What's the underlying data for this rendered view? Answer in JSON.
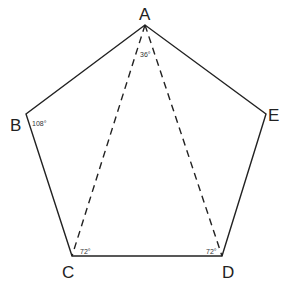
{
  "diagram": {
    "vertices": [
      {
        "label": "A",
        "x": 145,
        "y": 25
      },
      {
        "label": "B",
        "x": 26,
        "y": 114
      },
      {
        "label": "C",
        "x": 72,
        "y": 256
      },
      {
        "label": "D",
        "x": 222,
        "y": 256
      },
      {
        "label": "E",
        "x": 266,
        "y": 114
      }
    ],
    "angles": {
      "A": "36°",
      "B": "108°",
      "C": "72°",
      "D": "72°"
    },
    "colors": {
      "stroke": "#222222",
      "background": "#ffffff"
    }
  }
}
